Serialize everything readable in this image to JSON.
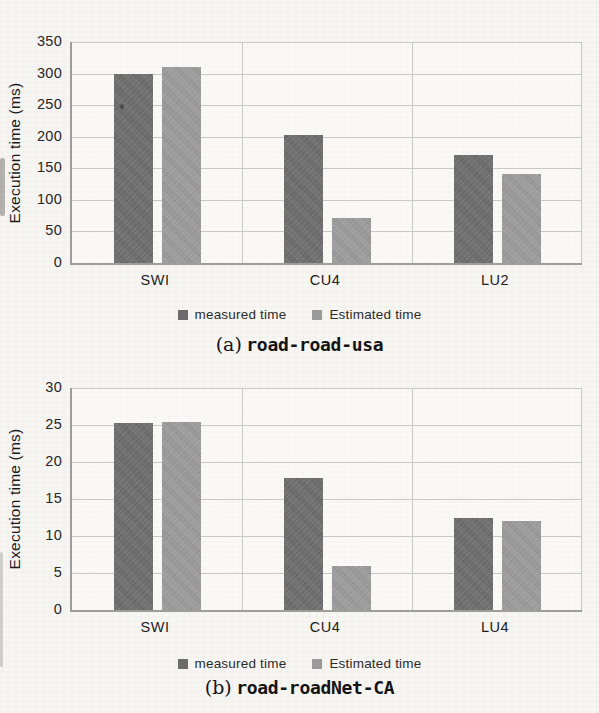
{
  "chart_data": [
    {
      "type": "bar",
      "caption_prefix": "(a)",
      "caption": "road-road-usa",
      "ylabel": "Execution time (ms)",
      "ylim": [
        0,
        350
      ],
      "ytick_step": 50,
      "yticks": [
        350,
        300,
        250,
        200,
        150,
        100,
        50,
        0
      ],
      "categories": [
        "SWI",
        "CU4",
        "LU2"
      ],
      "series": [
        {
          "name": "measured time",
          "color": "#6b6b6b",
          "values": [
            300,
            203,
            171
          ]
        },
        {
          "name": "Estimated time",
          "color": "#9a9a9a",
          "values": [
            311,
            72,
            141
          ]
        }
      ],
      "grid": true,
      "legend_position": "bottom"
    },
    {
      "type": "bar",
      "caption_prefix": "(b)",
      "caption": "road-roadNet-CA",
      "ylabel": "Execution time (ms)",
      "ylim": [
        0,
        30
      ],
      "ytick_step": 5,
      "yticks": [
        30,
        25,
        20,
        15,
        10,
        5,
        0
      ],
      "categories": [
        "SWI",
        "CU4",
        "LU4"
      ],
      "series": [
        {
          "name": "measured time",
          "color": "#6b6b6b",
          "values": [
            25.3,
            17.8,
            12.4
          ]
        },
        {
          "name": "Estimated time",
          "color": "#9a9a9a",
          "values": [
            25.4,
            6.0,
            12.0
          ]
        }
      ],
      "grid": true,
      "legend_position": "bottom"
    }
  ]
}
